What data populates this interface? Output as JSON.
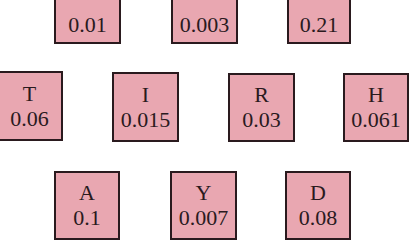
{
  "nodes": [
    {
      "id": "n1",
      "letter": "",
      "prob": "0.01",
      "x": 54,
      "y": -26,
      "w": 67,
      "h": 70,
      "row": "top"
    },
    {
      "id": "n2",
      "letter": "",
      "prob": "0.003",
      "x": 171,
      "y": -26,
      "w": 67,
      "h": 70,
      "row": "top"
    },
    {
      "id": "n3",
      "letter": "",
      "prob": "0.21",
      "x": 287,
      "y": -26,
      "w": 64,
      "h": 70,
      "row": "top"
    },
    {
      "id": "n4",
      "letter": "T",
      "prob": "0.06",
      "x": -4,
      "y": 71,
      "w": 67,
      "h": 70
    },
    {
      "id": "n5",
      "letter": "I",
      "prob": "0.015",
      "x": 112,
      "y": 72,
      "w": 67,
      "h": 70
    },
    {
      "id": "n6",
      "letter": "R",
      "prob": "0.03",
      "x": 228,
      "y": 73,
      "w": 67,
      "h": 69
    },
    {
      "id": "n7",
      "letter": "H",
      "prob": "0.061",
      "x": 343,
      "y": 73,
      "w": 66,
      "h": 69
    },
    {
      "id": "n8",
      "letter": "A",
      "prob": "0.1",
      "x": 54,
      "y": 171,
      "w": 66,
      "h": 69
    },
    {
      "id": "n9",
      "letter": "Y",
      "prob": "0.007",
      "x": 170,
      "y": 171,
      "w": 67,
      "h": 69
    },
    {
      "id": "n10",
      "letter": "D",
      "prob": "0.08",
      "x": 285,
      "y": 171,
      "w": 66,
      "h": 69
    }
  ],
  "colors": {
    "fill": "#e9a7b1",
    "border": "#2a1a1e"
  }
}
